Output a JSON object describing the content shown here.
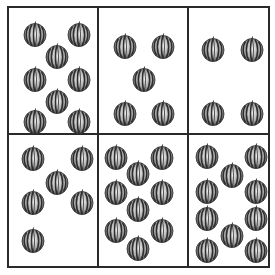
{
  "puzzle": {
    "object_icon": "watermelon-icon",
    "colors": {
      "border": "#2a2a2a",
      "melon_dark": "#2e2e2e",
      "melon_light": "#e6e6e6"
    },
    "cells": [
      {
        "row": 0,
        "col": 0,
        "count": 8,
        "positions": [
          [
            14,
            13
          ],
          [
            58,
            13
          ],
          [
            36,
            35
          ],
          [
            14,
            58
          ],
          [
            58,
            58
          ],
          [
            36,
            80
          ],
          [
            14,
            100
          ],
          [
            58,
            100
          ]
        ]
      },
      {
        "row": 0,
        "col": 1,
        "count": 5,
        "positions": [
          [
            14,
            25
          ],
          [
            52,
            25
          ],
          [
            33,
            58
          ],
          [
            14,
            92
          ],
          [
            52,
            92
          ]
        ]
      },
      {
        "row": 0,
        "col": 2,
        "count": 4,
        "positions": [
          [
            12,
            28
          ],
          [
            51,
            28
          ],
          [
            12,
            92
          ],
          [
            51,
            92
          ]
        ]
      },
      {
        "row": 1,
        "col": 0,
        "count": 6,
        "positions": [
          [
            12,
            10
          ],
          [
            61,
            10
          ],
          [
            36,
            34
          ],
          [
            12,
            54
          ],
          [
            61,
            54
          ],
          [
            12,
            92
          ],
          [
            61,
            92
          ]
        ]
      },
      {
        "row": 1,
        "col": 1,
        "count": 9,
        "positions": [
          [
            5,
            9
          ],
          [
            51,
            9
          ],
          [
            27,
            25
          ],
          [
            5,
            44
          ],
          [
            51,
            44
          ],
          [
            27,
            61
          ],
          [
            5,
            82
          ],
          [
            51,
            82
          ],
          [
            27,
            100
          ]
        ]
      },
      {
        "row": 1,
        "col": 2,
        "count": 10,
        "positions": [
          [
            6,
            8
          ],
          [
            55,
            8
          ],
          [
            31,
            27
          ],
          [
            6,
            43
          ],
          [
            55,
            43
          ],
          [
            6,
            70
          ],
          [
            55,
            70
          ],
          [
            31,
            87
          ],
          [
            6,
            102
          ],
          [
            55,
            102
          ]
        ]
      }
    ]
  }
}
